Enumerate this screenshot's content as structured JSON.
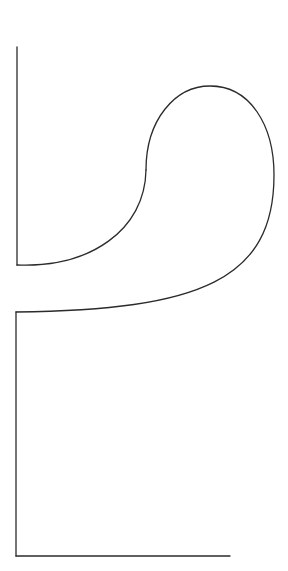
{
  "figure": {
    "stroke_color": "#2b2b2b",
    "background_color": "#ffffff",
    "canvas": {
      "width": 288,
      "height": 571
    },
    "segments": [
      {
        "name": "upper-left-vertical",
        "path": "M17 47 L17 265"
      },
      {
        "name": "lower-s-curve",
        "path": "M17 265 C90 268 145 230 146 170"
      },
      {
        "name": "upper-loop",
        "path": "M146 170 C146 120 175 86 210 86 C250 86 274 125 274 175 C274 280 200 310 16 312"
      },
      {
        "name": "lower-left-vertical",
        "path": "M16 312 L16 556"
      },
      {
        "name": "bottom-horizontal",
        "path": "M16 556 L230 556"
      }
    ]
  }
}
